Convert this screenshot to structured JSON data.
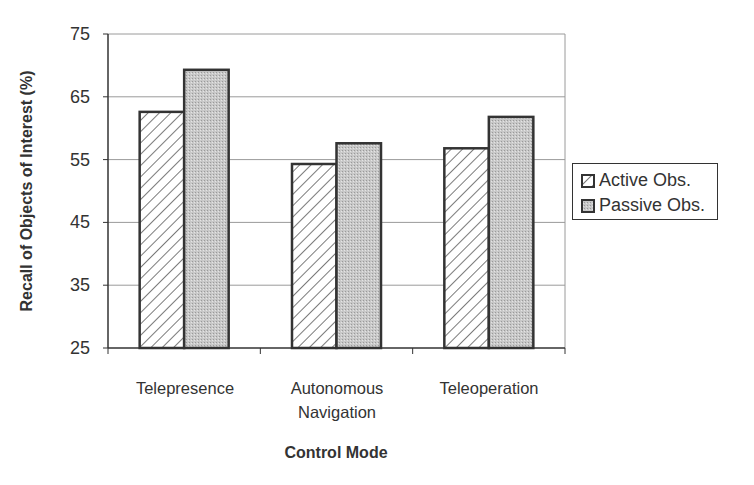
{
  "chart_data": {
    "type": "bar",
    "title": "",
    "xlabel": "Control Mode",
    "ylabel": "Recall of Objects of Interest (%)",
    "ylim": [
      25,
      75
    ],
    "yticks": [
      25,
      35,
      45,
      55,
      65,
      75
    ],
    "grid": true,
    "legend_position": "right",
    "categories": [
      "Telepresence",
      "Autonomous Navigation",
      "Teleoperation"
    ],
    "category_lines": [
      [
        "Telepresence"
      ],
      [
        "Autonomous",
        "Navigation"
      ],
      [
        "Teleoperation"
      ]
    ],
    "series": [
      {
        "name": "Active Obs.",
        "values": [
          62.6,
          54.3,
          56.8
        ],
        "pattern": "diagonal-hatch"
      },
      {
        "name": "Passive Obs.",
        "values": [
          69.3,
          57.6,
          61.8
        ],
        "pattern": "gray-stipple"
      }
    ]
  },
  "colors": {
    "axis": "#333333",
    "grid": "#9a9a9a",
    "passive_fill": "#c4c4c4",
    "hatch": "#333333"
  },
  "labels": {
    "y_axis": "Recall of Objects of Interest (%)",
    "x_axis": "Control Mode",
    "yticks": [
      "75",
      "65",
      "55",
      "45",
      "35",
      "25"
    ],
    "legend": [
      "Active Obs.",
      "Passive Obs."
    ]
  }
}
